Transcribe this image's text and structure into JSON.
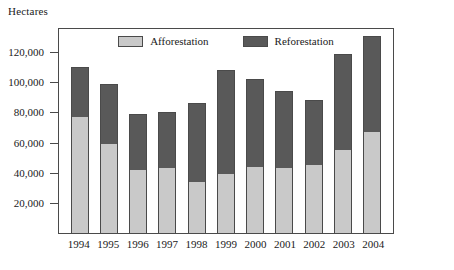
{
  "axis_title": "Hectares",
  "legend": {
    "position": "top-inside",
    "entries": [
      {
        "label": "Afforestation",
        "color": "#c9c9c9",
        "name": "legend-afforestation"
      },
      {
        "label": "Reforestation",
        "color": "#595959",
        "name": "legend-reforestation"
      }
    ]
  },
  "y_axis": {
    "ticks": [
      20000,
      40000,
      60000,
      80000,
      100000,
      120000
    ],
    "tick_labels": [
      "20,000",
      "40,000",
      "60,000",
      "80,000",
      "100,000",
      "120,000"
    ],
    "min": 0,
    "max": 136000
  },
  "chart_data": {
    "type": "bar",
    "subtype": "stacked-vertical",
    "title": "",
    "xlabel": "",
    "ylabel": "Hectares",
    "ylim": [
      0,
      136000
    ],
    "grid": false,
    "legend_position": "top-inside",
    "categories": [
      "1994",
      "1995",
      "1996",
      "1997",
      "1998",
      "1999",
      "2000",
      "2001",
      "2002",
      "2003",
      "2004"
    ],
    "series": [
      {
        "name": "Afforestation",
        "color": "#c9c9c9",
        "values": [
          77000,
          59000,
          42000,
          43000,
          34000,
          39000,
          44000,
          43000,
          45000,
          55000,
          67000
        ]
      },
      {
        "name": "Reforestation",
        "color": "#595959",
        "values": [
          33000,
          40000,
          37000,
          37000,
          52000,
          69000,
          58000,
          51000,
          43000,
          64000,
          64000
        ]
      }
    ],
    "totals": [
      110000,
      99000,
      79000,
      80000,
      86000,
      108000,
      102000,
      94000,
      88000,
      119000,
      131000
    ]
  }
}
